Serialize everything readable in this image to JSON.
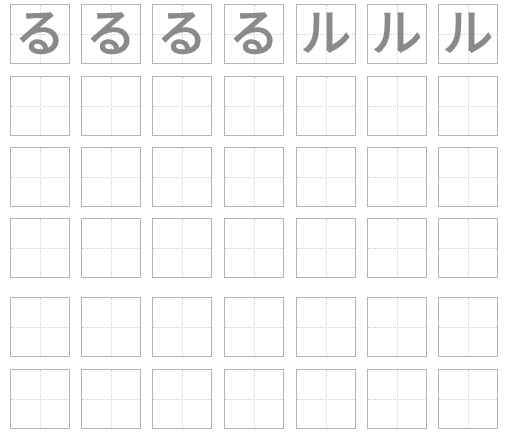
{
  "worksheet": {
    "columns": 7,
    "guide_color": "#cfcfcf",
    "border_color": "#b4b4b4",
    "glyph_color": "#8a8a8a",
    "model_row": [
      "る",
      "る",
      "る",
      "る",
      "ル",
      "ル",
      "ル"
    ],
    "practice_rows": 5
  }
}
